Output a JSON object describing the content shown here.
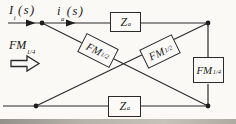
{
  "figure_type": "block-diagram",
  "labels": {
    "input_current": {
      "main": "I",
      "sub": "i",
      "paren": "(s)"
    },
    "armature_current": {
      "main": "i",
      "sub": "a",
      "paren": "(s)"
    },
    "fm_source": {
      "main": "FM",
      "sub": "1/4"
    }
  },
  "blocks": {
    "impedance_top": {
      "main": "Z",
      "sub": "a"
    },
    "impedance_bottom": {
      "main": "Z",
      "sub": "a"
    },
    "fm_cross_down": {
      "main": "FM",
      "sub": "1/2"
    },
    "fm_cross_up": {
      "main": "FM",
      "sub": "1/2"
    },
    "fm_right": {
      "main": "FM",
      "sub": "1/4"
    }
  },
  "colors": {
    "line": "#2b2b2b",
    "background": "#faf9f6",
    "scan_edge": "#b7b3aa"
  }
}
